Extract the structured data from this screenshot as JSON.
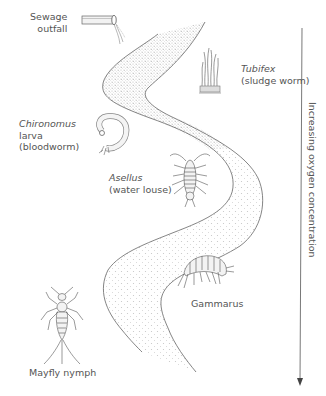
{
  "diagram": {
    "type": "river pollution indicator species diagram",
    "labels": {
      "sewage": {
        "line1": "Sewage",
        "line2": "outfall"
      },
      "tubifex": {
        "name": "Tubifex",
        "common": "(sludge worm)"
      },
      "chironomus": {
        "name": "Chironomus",
        "line2": "larva",
        "common": "(bloodworm)"
      },
      "asellus": {
        "name": "Asellus",
        "common": "(water louse)"
      },
      "gammarus": {
        "name": "Gammarus"
      },
      "mayfly": {
        "name": "Mayfly nymph"
      }
    },
    "axis": {
      "label": "Increasing oxygen concentration",
      "direction": "down"
    },
    "colors": {
      "line": "#555555",
      "text": "#555555",
      "stipple": "#bbbbbb",
      "background": "#ffffff"
    }
  }
}
